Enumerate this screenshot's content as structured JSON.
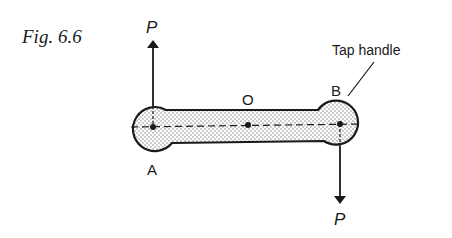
{
  "figure": {
    "caption": "Fig. 6.6",
    "callout": "Tap handle",
    "points": {
      "A": "A",
      "B": "B",
      "O": "O"
    },
    "forces": {
      "upper": "P",
      "lower": "P"
    }
  },
  "colors": {
    "stroke": "#1a1a1a",
    "fill": "#e6e6e6"
  }
}
